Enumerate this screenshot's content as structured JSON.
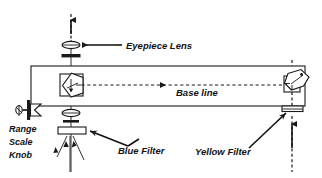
{
  "diagram": {
    "background_color": "#ffffff",
    "line_color": "#1a1a1a",
    "labels": {
      "eyepiece_lens": "Eyepiece Lens",
      "base_line": "Base line",
      "blue_filter": "Blue Filter",
      "yellow_filter": "Yellow Filter",
      "range_knob_line1": "Range",
      "range_knob_line2": "Scale",
      "range_knob_line3": "Knob"
    },
    "components": {
      "body_box": "rangefinder-body",
      "left_prism": "left-pentaprism",
      "right_prism": "right-pentaprism",
      "eyepiece_assembly": "eyepiece-optics",
      "objective_assembly": "objective-optics",
      "range_knob": "range-scale-knob",
      "blue_filter_element": "blue-filter-plate",
      "yellow_filter_element": "yellow-filter-plate"
    },
    "arrows": {
      "baseline_direction": "left",
      "eyepiece_pointer": "left",
      "light_path_up": "up"
    }
  }
}
